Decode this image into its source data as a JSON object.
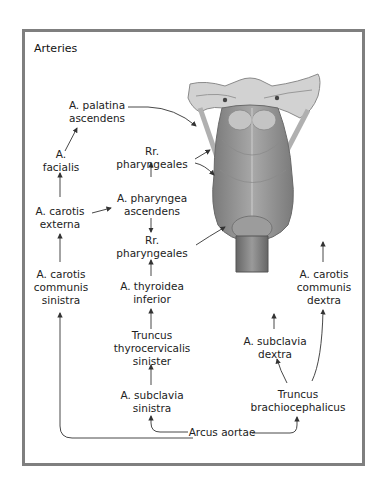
{
  "title": "Arteries",
  "colors": {
    "frame_border": "#7f7f7f",
    "text": "#222222",
    "arrow": "#333333",
    "illustration_dark": "#6e6e6e",
    "illustration_light": "#bdbdbd"
  },
  "illustration": {
    "name": "pharynx-posterior-view",
    "description": "Posterior view of the pharynx with skull base, constrictor muscles and esophagus"
  },
  "labels": {
    "palatina": {
      "line1": "A. palatina",
      "line2": "ascendens"
    },
    "facialis": {
      "line1": "A.",
      "line2": "facialis"
    },
    "carotis_externa": {
      "line1": "A. carotis",
      "line2": "externa"
    },
    "rr_pharyngeales_upper": {
      "line1": "Rr.",
      "line2": "pharyngeales"
    },
    "pharyngea_ascendens": {
      "line1": "A. pharyngea",
      "line2": "ascendens"
    },
    "rr_pharyngeales_lower": {
      "line1": "Rr.",
      "line2": "pharyngeales"
    },
    "carotis_communis_sinistra": {
      "line1": "A. carotis",
      "line2": "communis",
      "line3": "sinistra"
    },
    "thyroidea_inferior": {
      "line1": "A. thyroidea",
      "line2": "inferior"
    },
    "truncus_thyrocervicalis": {
      "line1": "Truncus",
      "line2": "thyrocervicalis",
      "line3": "sinister"
    },
    "subclavia_sinistra": {
      "line1": "A. subclavia",
      "line2": "sinistra"
    },
    "arcus_aortae": {
      "line1": "Arcus aortae"
    },
    "carotis_communis_dextra": {
      "line1": "A. carotis",
      "line2": "communis",
      "line3": "dextra"
    },
    "subclavia_dextra": {
      "line1": "A. subclavia",
      "line2": "dextra"
    },
    "truncus_brachiocephalicus": {
      "line1": "Truncus",
      "line2": "brachiocephalicus"
    }
  }
}
